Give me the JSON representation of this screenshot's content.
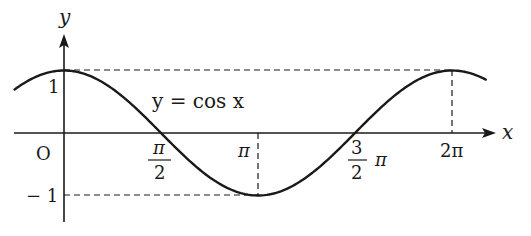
{
  "chart_data": {
    "type": "line",
    "title": "",
    "function_label": "y = cos x",
    "xlabel": "x",
    "ylabel": "y",
    "origin_label": "O",
    "x_ticks": [
      {
        "value": 1.5708,
        "num": "π",
        "den": "2",
        "label": "π/2"
      },
      {
        "value": 3.1416,
        "label": "π"
      },
      {
        "value": 4.7124,
        "num": "3",
        "den": "2",
        "suffix": "π",
        "label": "3/2 π"
      },
      {
        "value": 6.2832,
        "label": "2π"
      }
    ],
    "y_ticks": [
      {
        "value": 1,
        "label": "1"
      },
      {
        "value": -1,
        "label": "− 1"
      }
    ],
    "xlim": [
      -0.8,
      7.0
    ],
    "ylim": [
      -1.1,
      1.6
    ],
    "series": [
      {
        "name": "y = cos x",
        "x_range": [
          -0.8,
          6.83
        ],
        "points": [
          [
            0,
            1
          ],
          [
            1.5708,
            0
          ],
          [
            3.1416,
            -1
          ],
          [
            4.7124,
            0
          ],
          [
            6.2832,
            1
          ]
        ]
      }
    ],
    "guides": [
      {
        "type": "horizontal-dashed",
        "y": 1,
        "from_x": 0,
        "to_x": 6.2832
      },
      {
        "type": "vertical-dashed",
        "x": 6.2832,
        "from_y": 1,
        "to_y": 0
      },
      {
        "type": "horizontal-dashed",
        "y": -1,
        "from_x": 0,
        "to_x": 3.1416
      },
      {
        "type": "vertical-dashed",
        "x": 3.1416,
        "from_y": 0,
        "to_y": -1
      }
    ],
    "grid": false,
    "legend": "none"
  },
  "colors": {
    "line": "#1a1a1a",
    "background": "#ffffff"
  }
}
